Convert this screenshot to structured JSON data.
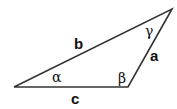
{
  "diagram": {
    "stroke_color": "#333333",
    "vertices": {
      "A": {
        "x": 14,
        "y": 87
      },
      "B": {
        "x": 128,
        "y": 87
      },
      "C": {
        "x": 172,
        "y": 9
      }
    },
    "sides": {
      "a": "a",
      "b": "b",
      "c": "c"
    },
    "angles": {
      "alpha": "α",
      "beta": "β",
      "gamma": "γ"
    }
  }
}
